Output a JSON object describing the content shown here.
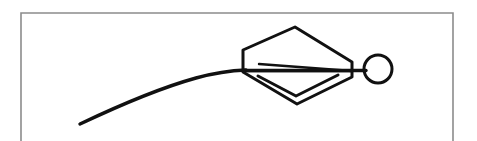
{
  "figure": {
    "title": "Line drawing figure",
    "background_color": "#ffffff",
    "ink_color": "#111111",
    "frame_color": "#8c8c8c",
    "canvas": {
      "width": 477,
      "height": 141
    },
    "frame": {
      "left": 21,
      "top": 13,
      "right": 453,
      "bottom_cutoff": 141,
      "stroke_width": 1.6,
      "sides_visible": "left, top, right; bottom cropped off the image"
    },
    "elements": [
      {
        "name": "arc-curve",
        "label": "Arcing trajectory line",
        "stroke_width": 3.4,
        "start": {
          "x": 80,
          "y": 124
        },
        "end": {
          "x": 246,
          "y": 70
        },
        "path": "M 80 124 C 118 106, 160 88, 196 78 C 216 72.5, 232 70.5, 246 70"
      },
      {
        "name": "hexagon-body",
        "label": "Hexagonal kite body",
        "stroke_width": 3.0,
        "vertices": [
          {
            "x": 243,
            "y": 50
          },
          {
            "x": 295,
            "y": 27
          },
          {
            "x": 352,
            "y": 62
          },
          {
            "x": 352,
            "y": 77
          },
          {
            "x": 297,
            "y": 104
          },
          {
            "x": 243,
            "y": 72
          }
        ],
        "path": "M 243 50 L 295 27 L 352 62 L 352 77 L 297 104 L 243 72 Z"
      },
      {
        "name": "inner-chevron",
        "label": "Nested V chevron inside lower body",
        "stroke_width": 3.0,
        "path": "M 258 76 L 296 96 L 338 75"
      },
      {
        "name": "needle-wedge-upper",
        "label": "Upper edge of thin needle wedge",
        "stroke_width": 2.4,
        "path": "M 259 64 L 352 71"
      },
      {
        "name": "needle-wedge-lower",
        "label": "Lower edge of thin needle wedge",
        "stroke_width": 2.4,
        "path": "M 246 71 L 352 71"
      },
      {
        "name": "axis-connector",
        "label": "Horizontal axis line through body to head",
        "stroke_width": 3.4,
        "path": "M 243 70.5 L 366 70.5"
      },
      {
        "name": "head-circle",
        "label": "Circular head at right end",
        "stroke_width": 3.0,
        "center": {
          "x": 378,
          "y": 69
        },
        "radius": 14
      }
    ]
  }
}
